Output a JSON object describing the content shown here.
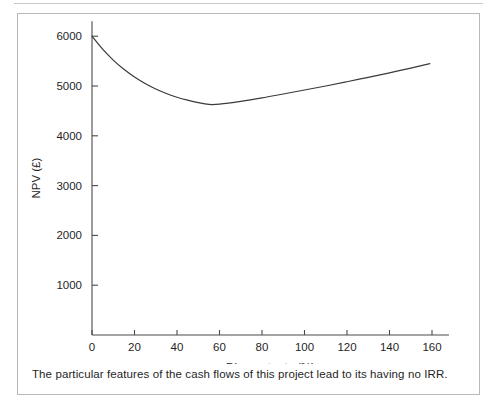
{
  "figure": {
    "caption": "The particular features of the cash flows of this project lead to its having no IRR."
  },
  "chart_data": {
    "type": "line",
    "title": "",
    "subtitle": "",
    "xlabel": "Discount rate (%)",
    "ylabel": "NPV (£)",
    "xlim": [
      0,
      168
    ],
    "ylim": [
      0,
      6300
    ],
    "grid": false,
    "legend": "none",
    "x_ticks": [
      0,
      20,
      40,
      60,
      80,
      100,
      120,
      140,
      160
    ],
    "x_tick_labels": [
      "0",
      "20",
      "40",
      "60",
      "80",
      "100",
      "120",
      "140",
      "160"
    ],
    "y_ticks": [
      1000,
      2000,
      3000,
      4000,
      5000,
      6000
    ],
    "y_tick_labels": [
      "1000",
      "2000",
      "3000",
      "4000",
      "5000",
      "6000"
    ],
    "line_color": "#3a3a3a",
    "axis_color": "#4a4a4a",
    "series": [
      {
        "name": "NPV vs discount rate",
        "x": [
          0,
          5,
          10,
          15,
          20,
          25,
          30,
          35,
          40,
          45,
          50,
          55,
          60,
          70,
          80,
          90,
          100,
          110,
          120,
          130,
          140,
          150,
          159
        ],
        "y": [
          6000,
          5740,
          5520,
          5335,
          5180,
          5050,
          4940,
          4850,
          4775,
          4715,
          4665,
          4630,
          4635,
          4690,
          4760,
          4840,
          4920,
          5000,
          5085,
          5175,
          5265,
          5360,
          5450
        ]
      }
    ],
    "annotations": []
  }
}
